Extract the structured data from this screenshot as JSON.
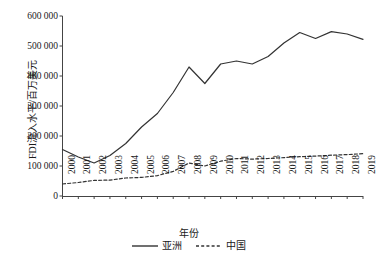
{
  "chart_data": {
    "type": "line",
    "title": "",
    "xlabel": "年份",
    "ylabel": "FDI流入水平/百万美元",
    "x": [
      2000,
      2001,
      2002,
      2003,
      2004,
      2005,
      2006,
      2007,
      2008,
      2009,
      2010,
      2011,
      2012,
      2013,
      2014,
      2015,
      2016,
      2017,
      2018,
      2019
    ],
    "categories": [
      "2000",
      "2001",
      "2002",
      "2003",
      "2004",
      "2005",
      "2006",
      "2007",
      "2008",
      "2009",
      "2010",
      "2011",
      "2012",
      "2013",
      "2014",
      "2015",
      "2016",
      "2017",
      "2018",
      "2019"
    ],
    "series": [
      {
        "name": "亚洲",
        "style": "solid",
        "color": "#333333",
        "values": [
          155000,
          130000,
          110000,
          135000,
          175000,
          230000,
          275000,
          345000,
          430000,
          375000,
          440000,
          450000,
          440000,
          465000,
          510000,
          545000,
          525000,
          548000,
          540000,
          522000
        ]
      },
      {
        "name": "中国",
        "style": "dashed",
        "color": "#333333",
        "values": [
          40000,
          45000,
          52000,
          53000,
          60000,
          62000,
          68000,
          82000,
          110000,
          100000,
          116000,
          125000,
          123000,
          125000,
          128000,
          131000,
          133000,
          136000,
          138000,
          141000
        ]
      }
    ],
    "yticks": [
      0,
      100000,
      200000,
      300000,
      400000,
      500000,
      600000
    ],
    "ytick_labels": [
      "0",
      "100 000",
      "200 000",
      "300 000",
      "400 000",
      "500 000",
      "600 000"
    ],
    "ylim": [
      0,
      600000
    ],
    "xlim": [
      2000,
      2019
    ],
    "grid": false,
    "legend_position": "bottom-center",
    "axes": {
      "left_spine": true,
      "bottom_spine": true,
      "top_spine": false,
      "right_spine": false,
      "tick_direction": "out"
    }
  }
}
